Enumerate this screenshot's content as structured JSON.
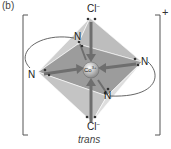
{
  "figure": {
    "panel_label": "(b)",
    "caption": "trans",
    "charge": "+",
    "metal_center": "Co",
    "metal_charge": "3+",
    "ligands": {
      "axial_top": {
        "symbol": "Cl",
        "charge": "−"
      },
      "axial_bottom": {
        "symbol": "Cl",
        "charge": "−"
      },
      "equatorial": [
        "N",
        "N",
        "N",
        "N"
      ]
    },
    "geometry": "octahedral",
    "colors": {
      "octahedron_light": "#d9d9d9",
      "octahedron_mid": "#b8b8b8",
      "octahedron_dark": "#8f8f8f",
      "arrow": "#6e6e6e",
      "bracket": "#555555"
    }
  }
}
